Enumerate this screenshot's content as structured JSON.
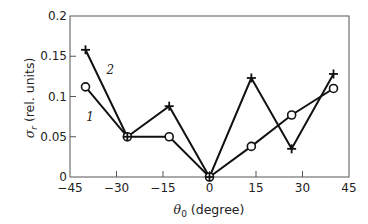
{
  "chart_data": {
    "type": "line",
    "title": "",
    "xlabel": "θ0 (degree)",
    "xlabel_main": "θ",
    "xlabel_sub": "0",
    "xlabel_rest": " (degree)",
    "ylabel": "σr (rel. units)",
    "ylabel_main": "σ",
    "ylabel_sub": "r",
    "ylabel_rest": " (rel. units)",
    "xlim": [
      -45,
      45
    ],
    "ylim": [
      0,
      0.2
    ],
    "xticks": [
      -45,
      -30,
      -15,
      0,
      15,
      30,
      45
    ],
    "xtick_labels": [
      "−45",
      "−30",
      "−15",
      "0",
      "15",
      "30",
      "45"
    ],
    "yticks": [
      0,
      0.05,
      0.1,
      0.15,
      0.2
    ],
    "ytick_labels": [
      "0",
      "0.05",
      "0.1",
      "0.15",
      "0.2"
    ],
    "grid": false,
    "legend": "inline labels",
    "series": [
      {
        "name": "1",
        "marker": "circle",
        "x": [
          -40,
          -26.5,
          -13,
          0,
          13.5,
          26.5,
          40
        ],
        "values": [
          0.112,
          0.05,
          0.05,
          0,
          0.038,
          0.077,
          0.11
        ]
      },
      {
        "name": "2",
        "marker": "plus",
        "x": [
          -40,
          -26.5,
          -13,
          0,
          13.5,
          26.5,
          40
        ],
        "values": [
          0.158,
          0.05,
          0.088,
          0,
          0.123,
          0.035,
          0.128
        ]
      }
    ],
    "annotations": [
      {
        "text": "1",
        "x": -38.5,
        "y": 0.069
      },
      {
        "text": "2",
        "x": -32,
        "y": 0.128
      }
    ]
  }
}
